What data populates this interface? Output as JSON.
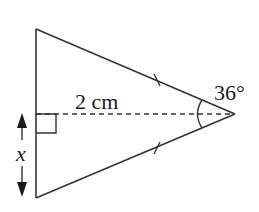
{
  "diagram": {
    "type": "isosceles-triangle",
    "labels": {
      "height": "2 cm",
      "apex_angle": "36°",
      "base_variable": "x"
    },
    "colors": {
      "stroke": "#333333",
      "text": "#1a1a1a",
      "background": "#ffffff"
    },
    "markers": {
      "equal_sides": "tick-marks-on-two-slanted-sides",
      "right_angle": "square-at-foot-of-altitude",
      "apex_angle_arc": true
    }
  }
}
